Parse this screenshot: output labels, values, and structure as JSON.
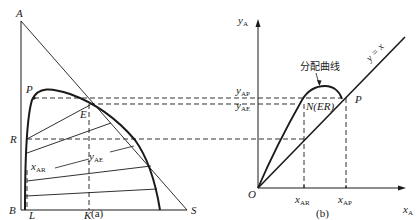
{
  "figure": {
    "panel_a": {
      "caption": "(a)",
      "vertices": {
        "A": "A",
        "B": "B",
        "S": "S"
      },
      "points": {
        "P": "P",
        "E": "E",
        "R": "R",
        "L": "L",
        "K": "K"
      },
      "annotations": {
        "x_AR": {
          "main": "x",
          "sub": "AR"
        },
        "y_AE": {
          "main": "y",
          "sub": "AE"
        }
      }
    },
    "panel_b": {
      "caption": "(b)",
      "origin": "O",
      "y_axis": {
        "main": "y",
        "sub": "A"
      },
      "x_axis": {
        "main": "x",
        "sub": "A"
      },
      "y_ticks": [
        {
          "main": "y",
          "sub": "AP"
        },
        {
          "main": "y",
          "sub": "AE"
        }
      ],
      "x_ticks": [
        {
          "main": "x",
          "sub": "AR"
        },
        {
          "main": "x",
          "sub": "AP"
        }
      ],
      "curve_label": "分配曲线",
      "diagonal_label": "y = x",
      "point_N": "N(ER)",
      "point_P": "P"
    },
    "colors": {
      "line": "#1a1a1a",
      "background": "#ffffff"
    }
  }
}
